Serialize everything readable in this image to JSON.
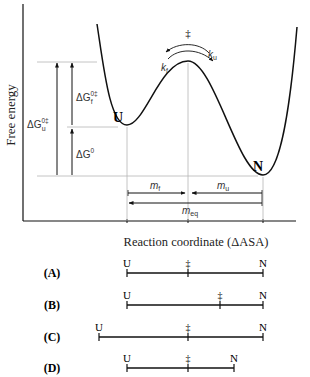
{
  "diagram": {
    "type": "free-energy-landscape",
    "y_axis_label": "Free energy",
    "x_axis_label": "Reaction coordinate (ΔASA)",
    "states": {
      "unfolded": "U",
      "native": "N",
      "transition": "‡"
    },
    "rate_labels": {
      "folding": "k",
      "folding_sub": "f",
      "unfolding": "k",
      "unfolding_sub": "u"
    },
    "energy_labels": {
      "dG_u": {
        "base": "ΔG",
        "sub": "u",
        "sup": "0‡"
      },
      "dG_f": {
        "base": "ΔG",
        "sub": "f",
        "sup": "0‡"
      },
      "dG0": {
        "base": "ΔG",
        "sup": "0"
      }
    },
    "m_labels": {
      "m_f": {
        "base": "m",
        "sub": "f"
      },
      "m_u": {
        "base": "m",
        "sub": "u"
      },
      "m_eq": {
        "base": "m",
        "sub": "eq"
      }
    }
  },
  "panels": [
    {
      "label": "(A)",
      "U": "U",
      "TS": "‡",
      "N": "N",
      "u_x": 127,
      "ts_x": 188,
      "n_x": 263
    },
    {
      "label": "(B)",
      "U": "U",
      "TS": "‡",
      "N": "N",
      "u_x": 127,
      "ts_x": 220,
      "n_x": 263
    },
    {
      "label": "(C)",
      "U": "U",
      "TS": "‡",
      "N": "N",
      "u_x": 99,
      "ts_x": 188,
      "n_x": 263
    },
    {
      "label": "(D)",
      "U": "U",
      "TS": "‡",
      "N": "N",
      "u_x": 127,
      "ts_x": 188,
      "n_x": 234
    }
  ],
  "colors": {
    "ink": "#111111",
    "guide": "#b5b5b5"
  }
}
